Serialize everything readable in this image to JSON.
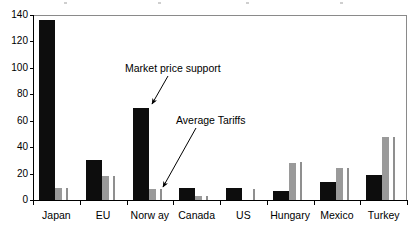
{
  "chart_data": {
    "type": "bar",
    "title": "",
    "xlabel": "",
    "ylabel": "",
    "ylim": [
      0,
      140
    ],
    "yticks": [
      0,
      20,
      40,
      60,
      80,
      100,
      120,
      140
    ],
    "grid": false,
    "legend_position": "none",
    "categories": [
      "Japan",
      "EU",
      "Norw ay",
      "Canada",
      "US",
      "Hungary",
      "Mexico",
      "Turkey"
    ],
    "series": [
      {
        "name": "Market price support",
        "color": "#0d0d0d",
        "values": [
          136,
          30,
          70,
          9,
          9,
          7,
          14,
          19
        ]
      },
      {
        "name": "Average Tariffs",
        "color": "#9a9a9a",
        "values": [
          9,
          18,
          8,
          3,
          0,
          28,
          24,
          48
        ]
      },
      {
        "name": "Average Tariffs marker",
        "color": "#8f8f8f",
        "values": [
          9,
          18,
          8,
          3,
          8,
          29,
          24,
          48
        ]
      }
    ],
    "annotations": [
      {
        "name": "market-price-support",
        "text": "Market price support",
        "label_x": 125,
        "label_y": 62,
        "arrow": {
          "x1": 168,
          "y1": 76,
          "x2": 152,
          "y2": 104
        }
      },
      {
        "name": "average-tariffs",
        "text": "Average Tariffs",
        "label_x": 176,
        "label_y": 114,
        "arrow": {
          "x1": 196,
          "y1": 128,
          "x2": 163,
          "y2": 187
        }
      }
    ]
  },
  "axis": {
    "ytick_labels": [
      "140",
      "120",
      "100",
      "80",
      "60",
      "40",
      "20",
      "0"
    ]
  }
}
